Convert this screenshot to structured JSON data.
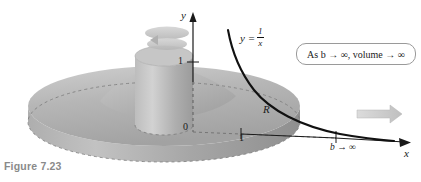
{
  "figure": {
    "caption": "Figure 7.23",
    "background": "#ffffff",
    "ink": "#1a1a1a",
    "caption_color": "#8a8a8a"
  },
  "callout": {
    "text": "As b → ∞, volume → ∞",
    "border_color": "#9a9a9a"
  },
  "axes": {
    "y_label": "y",
    "x_label": "x",
    "origin_label": "0",
    "x_tick_label": "1",
    "y_tick_label": "1"
  },
  "annotations": {
    "curve_equation_lhs": "y =",
    "curve_numerator": "1",
    "curve_denominator": "x",
    "region_label": "R",
    "limit_label": "b → ∞"
  },
  "solid": {
    "description": "solid-of-revolution-disk",
    "disk_top_color": "#b9b9b9",
    "disk_side_color": "#9d9d9d",
    "cylinder_color": "#b0b0b0",
    "dashed_color": "#7d7d7d",
    "rotation_indicator_color": "#c3c3c3",
    "block_arrow_color": "#c9c9c9"
  }
}
